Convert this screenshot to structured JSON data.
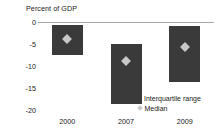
{
  "chart_data": {
    "type": "bar",
    "title": "",
    "ylabel": "Percent of GDP",
    "xlabel": "",
    "categories": [
      "2000",
      "2007",
      "2009"
    ],
    "ylim": [
      -20,
      0
    ],
    "yticks": [
      0,
      -5,
      -10,
      -15,
      -20
    ],
    "ytick_labels": [
      "0",
      "-5",
      "-10",
      "-15",
      "-20"
    ],
    "grid": false,
    "legend_position": "inside-bottom-right",
    "legend": [
      {
        "label": "Interquartile range",
        "marker": "square",
        "color": "#3a3a3a"
      },
      {
        "label": "Median",
        "marker": "diamond",
        "color": "#c8c8c8"
      }
    ],
    "series": [
      {
        "name": "Interquartile range",
        "type": "range-bar",
        "color": "#3a3a3a",
        "upper": [
          -0.7,
          -5.0,
          -0.9
        ],
        "lower": [
          -7.5,
          -18.6,
          -13.6
        ]
      },
      {
        "name": "Median",
        "type": "marker",
        "color": "#c8c8c8",
        "values": [
          -3.9,
          -8.9,
          -5.7
        ]
      }
    ]
  },
  "axis": {
    "title": "Percent of GDP"
  }
}
